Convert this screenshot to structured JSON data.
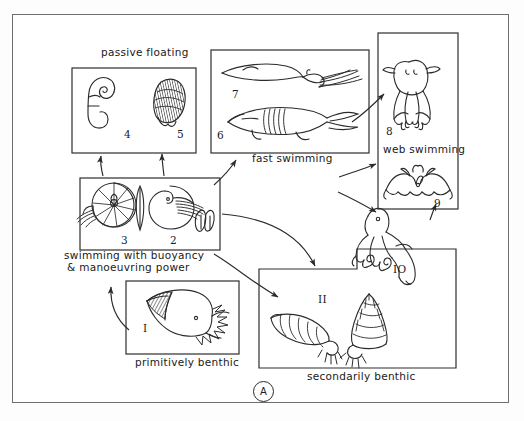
{
  "figure": {
    "panel_label": "A"
  },
  "groups": [
    {
      "key": "passive-floating",
      "caption": "passive floating",
      "caption_pos": "top",
      "box": {
        "x": 72,
        "y": 68,
        "w": 124,
        "h": 85
      },
      "caption_xy": {
        "x": 101,
        "y": 53
      },
      "items": [
        {
          "number": "4",
          "label_xy": {
            "x": 124,
            "y": 134
          },
          "organism": "coiled-spirula-shell"
        },
        {
          "number": "5",
          "label_xy": {
            "x": 177,
            "y": 134
          },
          "organism": "shaded-conical-shell"
        }
      ]
    },
    {
      "key": "fast-swimming",
      "caption": "fast swimming",
      "caption_pos": "bottom",
      "box": {
        "x": 211,
        "y": 50,
        "w": 158,
        "h": 103
      },
      "caption_xy": {
        "x": 252,
        "y": 157
      },
      "items": [
        {
          "number": "7",
          "label_xy": {
            "x": 232,
            "y": 94
          },
          "organism": "squid-teuthid"
        },
        {
          "number": "6",
          "label_xy": {
            "x": 217,
            "y": 135
          },
          "organism": "belemnite-like-cephalopod"
        }
      ]
    },
    {
      "key": "web-swimming",
      "caption": "web swimming",
      "caption_pos": "inside",
      "box": {
        "x": 378,
        "y": 33,
        "w": 80,
        "h": 176
      },
      "caption_xy": {
        "x": 383,
        "y": 148
      },
      "items": [
        {
          "number": "8",
          "label_xy": {
            "x": 386,
            "y": 131
          },
          "organism": "vampyroteuthis-webbed-octopod"
        },
        {
          "number": "9",
          "label_xy": {
            "x": 434,
            "y": 203
          },
          "organism": "cirrate-octopod-umbrella"
        }
      ]
    },
    {
      "key": "swimming-buoyancy",
      "caption": "swimming with buoyancy",
      "caption_line2": "& manoeuvring power",
      "caption_pos": "bottom",
      "box": {
        "x": 80,
        "y": 178,
        "w": 140,
        "h": 72
      },
      "caption_xy": {
        "x": 64,
        "y": 253
      },
      "items": [
        {
          "number": "3",
          "label_xy": {
            "x": 121,
            "y": 240
          },
          "organism": "coiled-ammonite"
        },
        {
          "number": "2",
          "label_xy": {
            "x": 170,
            "y": 240
          },
          "organism": "nautilus-and-cuttlebone"
        }
      ]
    },
    {
      "key": "primitively-benthic",
      "caption": "primitively benthic",
      "caption_pos": "bottom",
      "box": {
        "x": 126,
        "y": 281,
        "w": 113,
        "h": 73
      },
      "caption_xy": {
        "x": 135,
        "y": 360
      },
      "items": [
        {
          "number": "I",
          "label_xy": {
            "x": 143,
            "y": 328
          },
          "organism": "monoplacophoran-limpet"
        }
      ]
    },
    {
      "key": "secondarily-benthic",
      "caption": "secondarily benthic",
      "caption_pos": "bottom",
      "box": {
        "x": 259,
        "y": 269,
        "w": 197,
        "h": 99
      },
      "caption_xy": {
        "x": 307,
        "y": 374
      },
      "items": [
        {
          "number": "II",
          "label_xy": {
            "x": 318,
            "y": 299
          },
          "organism": "two-benthic-gastropod-shells"
        }
      ]
    },
    {
      "key": "free-item-10",
      "caption": "",
      "items": [
        {
          "number": "IO",
          "label_xy": {
            "x": 393,
            "y": 269
          },
          "organism": "benthic-octopus"
        }
      ]
    }
  ],
  "arrows": [
    {
      "from": "swimming-buoyancy",
      "to": "passive-floating",
      "name": "arrow-buoyancy-to-floating-left"
    },
    {
      "from": "swimming-buoyancy",
      "to": "passive-floating",
      "name": "arrow-buoyancy-to-floating-right"
    },
    {
      "from": "swimming-buoyancy",
      "to": "fast-swimming",
      "name": "arrow-buoyancy-to-fast-swimming"
    },
    {
      "from": "fast-swimming",
      "to": "web-swimming",
      "name": "arrow-fast-swimming-to-web-swimming"
    },
    {
      "from": "swimming-buoyancy",
      "to": "web-swimming",
      "name": "arrow-buoyancy-to-web-upper"
    },
    {
      "from": "swimming-buoyancy",
      "to": "web-swimming",
      "name": "arrow-buoyancy-to-web-lower"
    },
    {
      "from": "swimming-buoyancy",
      "to": "secondarily-benthic",
      "name": "arrow-buoyancy-to-secondarily-benthic"
    },
    {
      "from": "fast-swimming",
      "to": "secondarily-benthic",
      "name": "arrow-fast-swimming-to-secondarily-benthic"
    },
    {
      "from": "primitively-benthic",
      "to": "swimming-buoyancy",
      "name": "arrow-primitively-benthic-to-buoyancy"
    },
    {
      "from": "free-item-10",
      "to": "web-swimming",
      "name": "arrow-octopus-to-web-swimming"
    }
  ]
}
